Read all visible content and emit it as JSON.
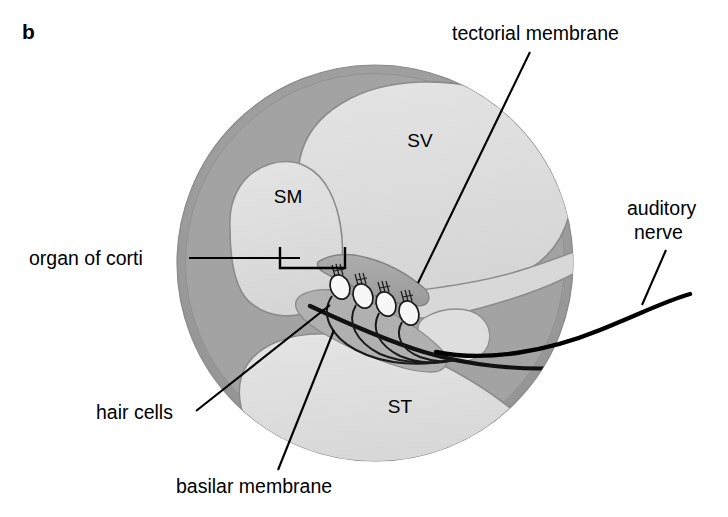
{
  "figure": {
    "panel_letter": "b",
    "background_color": "#ffffff"
  },
  "colors": {
    "bone_outer": "#9c9c9c",
    "bone_mid": "#ababab",
    "chamber_fill": "#dcdcdc",
    "chamber_fill_light": "#e2e2e2",
    "tissue_mid": "#b4b4b4",
    "tectorial_membrane": "#a2a2a2",
    "hair_cell_fill": "#f6f6f6",
    "outline": "#7e7e7e",
    "ink": "#000000"
  },
  "chamber_labels": [
    {
      "id": "sv",
      "text": "SV",
      "meaning": "scala vestibuli",
      "x": 420,
      "y": 147
    },
    {
      "id": "sm",
      "text": "SM",
      "meaning": "scala media",
      "x": 288,
      "y": 203
    },
    {
      "id": "st",
      "text": "ST",
      "meaning": "scala tympani",
      "x": 400,
      "y": 413
    }
  ],
  "callouts": [
    {
      "id": "tectorial-membrane",
      "text": "tectorial membrane",
      "x": 452,
      "y": 40,
      "anchor": "start",
      "lines": 1
    },
    {
      "id": "organ-of-corti",
      "text": "organ of corti",
      "x": 29,
      "y": 265,
      "anchor": "start",
      "lines": 1
    },
    {
      "id": "auditory-nerve",
      "text_line_1": "auditory",
      "text_line_2": "nerve",
      "x": 627,
      "y": 215,
      "anchor": "start",
      "lines": 2
    },
    {
      "id": "hair-cells",
      "text": "hair cells",
      "x": 96,
      "y": 419,
      "anchor": "start",
      "lines": 1
    },
    {
      "id": "basilar-membrane",
      "text": "basilar membrane",
      "x": 176,
      "y": 493,
      "anchor": "start",
      "lines": 1
    }
  ],
  "structures": {
    "hair_cell_count": 4,
    "hair_cells": [
      {
        "cx": 340,
        "cy": 287,
        "rx": 9.5,
        "ry": 12.5,
        "rot": -22
      },
      {
        "cx": 363,
        "cy": 296,
        "rx": 9.5,
        "ry": 12.5,
        "rot": -22
      },
      {
        "cx": 386,
        "cy": 304,
        "rx": 9.5,
        "ry": 12.5,
        "rot": -22
      },
      {
        "cx": 409,
        "cy": 313,
        "rx": 9.5,
        "ry": 12.5,
        "rot": -22
      }
    ],
    "stereocilia_bundles": 4,
    "cochlea_circle": {
      "cx": 375,
      "cy": 263,
      "r": 198
    }
  }
}
